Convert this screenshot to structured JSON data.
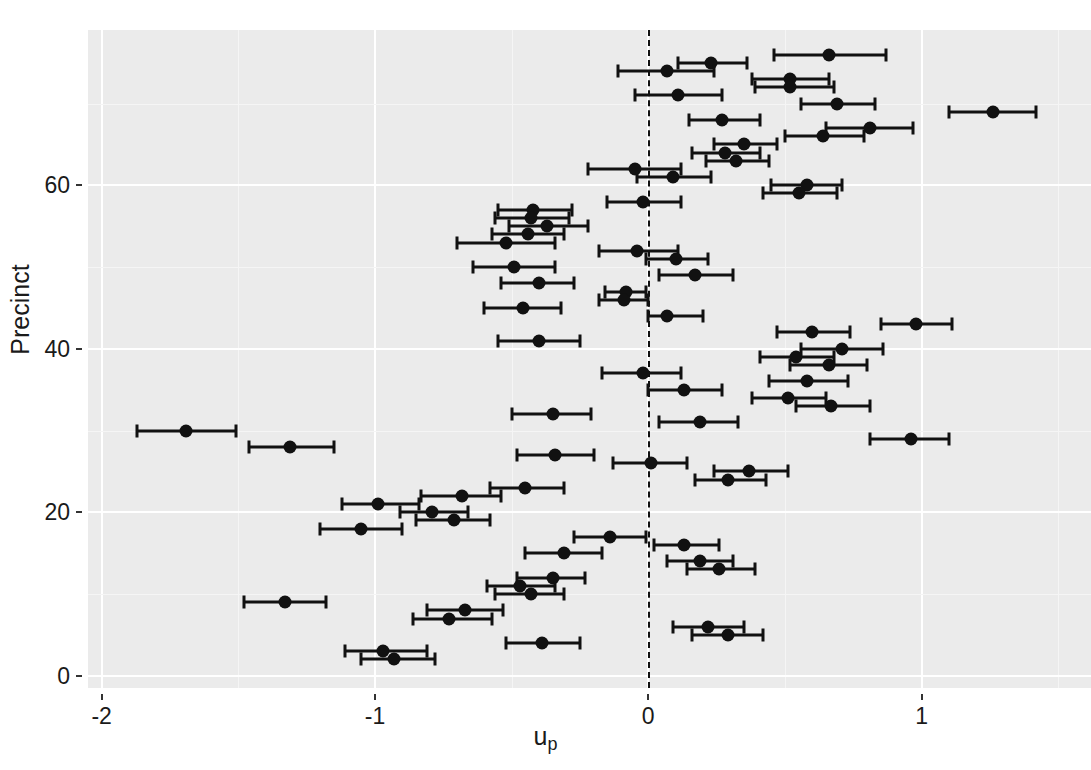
{
  "chart_data": {
    "type": "scatter",
    "subtype": "caterpillar-forest-plot",
    "title": "",
    "xlabel": "u_p",
    "xlabel_base": "u",
    "xlabel_sub": "p",
    "ylabel": "Precinct",
    "xlim": [
      -2.05,
      1.62
    ],
    "ylim": [
      -1.5,
      79
    ],
    "xticks": [
      -2,
      -1,
      0,
      1
    ],
    "xtick_labels": [
      "-2",
      "-1",
      "0",
      "1"
    ],
    "yticks": [
      0,
      20,
      40,
      60
    ],
    "ytick_labels": [
      "0",
      "20",
      "40",
      "60"
    ],
    "grid": "major-and-minor white on grey panel",
    "panel_fill": "#ebebeb",
    "grid_major_color": "#ffffff",
    "grid_minor_color": "#f5f5f5",
    "point_color": "#111111",
    "reference_line": {
      "x": 0,
      "style": "dashed",
      "color": "#111111"
    },
    "legend": "none",
    "error_bar_meaning": "credible interval per precinct random effect",
    "n_points": 76,
    "series_name": "precinct random effect u_p",
    "points": [
      {
        "precinct": 76,
        "x": 0.66,
        "lo": 0.46,
        "hi": 0.87
      },
      {
        "precinct": 75,
        "x": 0.23,
        "lo": 0.11,
        "hi": 0.36
      },
      {
        "precinct": 74,
        "x": 0.07,
        "lo": -0.11,
        "hi": 0.24
      },
      {
        "precinct": 73,
        "x": 0.52,
        "lo": 0.38,
        "hi": 0.66
      },
      {
        "precinct": 72,
        "x": 0.52,
        "lo": 0.39,
        "hi": 0.68
      },
      {
        "precinct": 71,
        "x": 0.11,
        "lo": -0.05,
        "hi": 0.27
      },
      {
        "precinct": 70,
        "x": 0.69,
        "lo": 0.56,
        "hi": 0.83
      },
      {
        "precinct": 69,
        "x": 1.26,
        "lo": 1.1,
        "hi": 1.42
      },
      {
        "precinct": 68,
        "x": 0.27,
        "lo": 0.15,
        "hi": 0.41
      },
      {
        "precinct": 67,
        "x": 0.81,
        "lo": 0.65,
        "hi": 0.97
      },
      {
        "precinct": 66,
        "x": 0.64,
        "lo": 0.5,
        "hi": 0.79
      },
      {
        "precinct": 65,
        "x": 0.35,
        "lo": 0.24,
        "hi": 0.47
      },
      {
        "precinct": 64,
        "x": 0.28,
        "lo": 0.16,
        "hi": 0.41
      },
      {
        "precinct": 63,
        "x": 0.32,
        "lo": 0.21,
        "hi": 0.44
      },
      {
        "precinct": 62,
        "x": -0.05,
        "lo": -0.22,
        "hi": 0.12
      },
      {
        "precinct": 61,
        "x": 0.09,
        "lo": -0.04,
        "hi": 0.23
      },
      {
        "precinct": 60,
        "x": 0.58,
        "lo": 0.45,
        "hi": 0.71
      },
      {
        "precinct": 59,
        "x": 0.55,
        "lo": 0.42,
        "hi": 0.69
      },
      {
        "precinct": 58,
        "x": -0.02,
        "lo": -0.15,
        "hi": 0.12
      },
      {
        "precinct": 57,
        "x": -0.42,
        "lo": -0.55,
        "hi": -0.28
      },
      {
        "precinct": 56,
        "x": -0.43,
        "lo": -0.56,
        "hi": -0.29
      },
      {
        "precinct": 55,
        "x": -0.37,
        "lo": -0.51,
        "hi": -0.22
      },
      {
        "precinct": 54,
        "x": -0.44,
        "lo": -0.57,
        "hi": -0.31
      },
      {
        "precinct": 53,
        "x": -0.52,
        "lo": -0.7,
        "hi": -0.34
      },
      {
        "precinct": 52,
        "x": -0.04,
        "lo": -0.18,
        "hi": 0.11
      },
      {
        "precinct": 51,
        "x": 0.1,
        "lo": -0.01,
        "hi": 0.22
      },
      {
        "precinct": 50,
        "x": -0.49,
        "lo": -0.64,
        "hi": -0.34
      },
      {
        "precinct": 49,
        "x": 0.17,
        "lo": 0.04,
        "hi": 0.31
      },
      {
        "precinct": 48,
        "x": -0.4,
        "lo": -0.54,
        "hi": -0.27
      },
      {
        "precinct": 47,
        "x": -0.08,
        "lo": -0.16,
        "hi": -0.01
      },
      {
        "precinct": 46,
        "x": -0.09,
        "lo": -0.18,
        "hi": 0.0
      },
      {
        "precinct": 45,
        "x": -0.46,
        "lo": -0.6,
        "hi": -0.32
      },
      {
        "precinct": 44,
        "x": 0.07,
        "lo": 0.0,
        "hi": 0.2
      },
      {
        "precinct": 43,
        "x": 0.98,
        "lo": 0.85,
        "hi": 1.11
      },
      {
        "precinct": 42,
        "x": 0.6,
        "lo": 0.47,
        "hi": 0.74
      },
      {
        "precinct": 41,
        "x": -0.4,
        "lo": -0.55,
        "hi": -0.25
      },
      {
        "precinct": 40,
        "x": 0.71,
        "lo": 0.56,
        "hi": 0.86
      },
      {
        "precinct": 39,
        "x": 0.54,
        "lo": 0.41,
        "hi": 0.68
      },
      {
        "precinct": 38,
        "x": 0.66,
        "lo": 0.52,
        "hi": 0.8
      },
      {
        "precinct": 37,
        "x": -0.02,
        "lo": -0.17,
        "hi": 0.12
      },
      {
        "precinct": 36,
        "x": 0.58,
        "lo": 0.44,
        "hi": 0.73
      },
      {
        "precinct": 35,
        "x": 0.13,
        "lo": 0.0,
        "hi": 0.27
      },
      {
        "precinct": 34,
        "x": 0.51,
        "lo": 0.38,
        "hi": 0.65
      },
      {
        "precinct": 33,
        "x": 0.67,
        "lo": 0.54,
        "hi": 0.81
      },
      {
        "precinct": 32,
        "x": -0.35,
        "lo": -0.5,
        "hi": -0.21
      },
      {
        "precinct": 31,
        "x": 0.19,
        "lo": 0.04,
        "hi": 0.33
      },
      {
        "precinct": 30,
        "x": -1.69,
        "lo": -1.87,
        "hi": -1.51
      },
      {
        "precinct": 29,
        "x": 0.96,
        "lo": 0.81,
        "hi": 1.1
      },
      {
        "precinct": 28,
        "x": -1.31,
        "lo": -1.46,
        "hi": -1.15
      },
      {
        "precinct": 27,
        "x": -0.34,
        "lo": -0.48,
        "hi": -0.2
      },
      {
        "precinct": 26,
        "x": 0.01,
        "lo": -0.13,
        "hi": 0.14
      },
      {
        "precinct": 25,
        "x": 0.37,
        "lo": 0.24,
        "hi": 0.51
      },
      {
        "precinct": 24,
        "x": 0.29,
        "lo": 0.17,
        "hi": 0.43
      },
      {
        "precinct": 23,
        "x": -0.45,
        "lo": -0.58,
        "hi": -0.31
      },
      {
        "precinct": 22,
        "x": -0.68,
        "lo": -0.83,
        "hi": -0.54
      },
      {
        "precinct": 21,
        "x": -0.99,
        "lo": -1.12,
        "hi": -0.84
      },
      {
        "precinct": 20,
        "x": -0.79,
        "lo": -0.91,
        "hi": -0.66
      },
      {
        "precinct": 19,
        "x": -0.71,
        "lo": -0.85,
        "hi": -0.58
      },
      {
        "precinct": 18,
        "x": -1.05,
        "lo": -1.2,
        "hi": -0.9
      },
      {
        "precinct": 17,
        "x": -0.14,
        "lo": -0.27,
        "hi": -0.01
      },
      {
        "precinct": 16,
        "x": 0.13,
        "lo": 0.02,
        "hi": 0.26
      },
      {
        "precinct": 15,
        "x": -0.31,
        "lo": -0.45,
        "hi": -0.17
      },
      {
        "precinct": 14,
        "x": 0.19,
        "lo": 0.07,
        "hi": 0.31
      },
      {
        "precinct": 13,
        "x": 0.26,
        "lo": 0.14,
        "hi": 0.39
      },
      {
        "precinct": 12,
        "x": -0.35,
        "lo": -0.48,
        "hi": -0.23
      },
      {
        "precinct": 11,
        "x": -0.47,
        "lo": -0.59,
        "hi": -0.34
      },
      {
        "precinct": 10,
        "x": -0.43,
        "lo": -0.56,
        "hi": -0.31
      },
      {
        "precinct": 9,
        "x": -1.33,
        "lo": -1.48,
        "hi": -1.18
      },
      {
        "precinct": 8,
        "x": -0.67,
        "lo": -0.81,
        "hi": -0.53
      },
      {
        "precinct": 7,
        "x": -0.73,
        "lo": -0.86,
        "hi": -0.57
      },
      {
        "precinct": 6,
        "x": 0.22,
        "lo": 0.09,
        "hi": 0.35
      },
      {
        "precinct": 5,
        "x": 0.29,
        "lo": 0.16,
        "hi": 0.42
      },
      {
        "precinct": 4,
        "x": -0.39,
        "lo": -0.52,
        "hi": -0.25
      },
      {
        "precinct": 3,
        "x": -0.97,
        "lo": -1.11,
        "hi": -0.81
      },
      {
        "precinct": 2,
        "x": -0.93,
        "lo": -1.05,
        "hi": -0.78
      }
    ]
  }
}
